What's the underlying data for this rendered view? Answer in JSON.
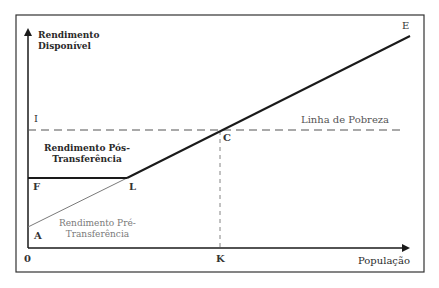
{
  "diagram": {
    "y_axis_label_line1": "Rendimento",
    "y_axis_label_line2": "Disponível",
    "x_axis_label": "População",
    "origin_label": "0",
    "poverty_line_label": "Linha de Pobreza",
    "post_transfer_label_line1": "Rendimento Pós-",
    "post_transfer_label_line2": "Transferência",
    "pre_transfer_label_line1": "Rendimento Pré-",
    "pre_transfer_label_line2": "Transferência",
    "points": {
      "A": "A",
      "C": "C",
      "E": "E",
      "F": "F",
      "I": "I",
      "K": "K",
      "L": "L"
    },
    "colors": {
      "axis": "#1a1a1a",
      "thick_line": "#1a1a1a",
      "thin_line": "#7a7a7a",
      "dashed": "#555555",
      "frame": "#333333"
    }
  }
}
